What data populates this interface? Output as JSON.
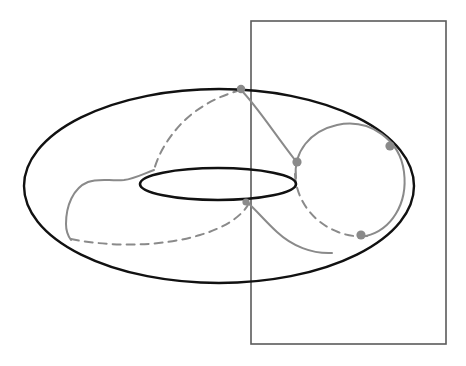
{
  "figure": {
    "background_color": "#ffffff",
    "width": 466,
    "height": 366,
    "caption": ""
  },
  "colors": {
    "torus_outline": "#111111",
    "plane_outline": "#5b5b5b",
    "curve_solid": "#8a8a8a",
    "curve_hidden": "#8a8a8a",
    "intersection_point": "#8a8a8a"
  },
  "shapes": {
    "outer_ellipse": {
      "name": "torus-outer-silhouette",
      "cx": 219,
      "cy": 186,
      "rx": 195,
      "ry": 97,
      "stroke": "#111111",
      "style": "solid"
    },
    "inner_ellipse": {
      "name": "torus-inner-hole",
      "cx": 218,
      "cy": 184,
      "rx": 78,
      "ry": 16,
      "stroke": "#111111",
      "style": "solid"
    },
    "cutting_plane": {
      "name": "cutting-plane-rectangle",
      "x": 251,
      "y": 21,
      "width": 195,
      "height": 323,
      "stroke": "#5b5b5b",
      "style": "solid"
    }
  },
  "curves": [
    {
      "name": "meridian-circle-right",
      "style": "solid",
      "color": "#8a8a8a",
      "description": "Gray meridian circle on the right side of the torus"
    },
    {
      "name": "meridian-circle-right-hidden",
      "style": "dashed",
      "color": "#8a8a8a",
      "description": "Hidden back half of the right meridian circle"
    },
    {
      "name": "geodesic-front-left",
      "style": "solid",
      "color": "#8a8a8a",
      "description": "Gray geodesic arc wrapping the front-left of the torus"
    },
    {
      "name": "geodesic-back-upper",
      "style": "dashed",
      "color": "#8a8a8a",
      "description": "Hidden geodesic arc across the back upper surface"
    },
    {
      "name": "geodesic-back-lower",
      "style": "dashed",
      "color": "#8a8a8a",
      "description": "Hidden geodesic arc across the back lower surface"
    },
    {
      "name": "geodesic-chord-top",
      "style": "solid",
      "color": "#8a8a8a",
      "description": "Gray segment descending from the top of the torus to the meridian circle"
    }
  ],
  "points": [
    {
      "name": "intersection-point-top",
      "cx": 241,
      "cy": 89,
      "r": 4.2,
      "label": ""
    },
    {
      "name": "intersection-point-upper-right",
      "cx": 297,
      "cy": 162,
      "r": 4.6,
      "label": ""
    },
    {
      "name": "intersection-point-outer-right",
      "cx": 390,
      "cy": 146,
      "r": 4.6,
      "label": ""
    },
    {
      "name": "intersection-point-lower-right",
      "cx": 361,
      "cy": 235,
      "r": 4.6,
      "label": ""
    },
    {
      "name": "intersection-point-inner-lower",
      "cx": 246,
      "cy": 202,
      "r": 3.6,
      "label": ""
    }
  ],
  "annotations": {
    "labels": []
  }
}
